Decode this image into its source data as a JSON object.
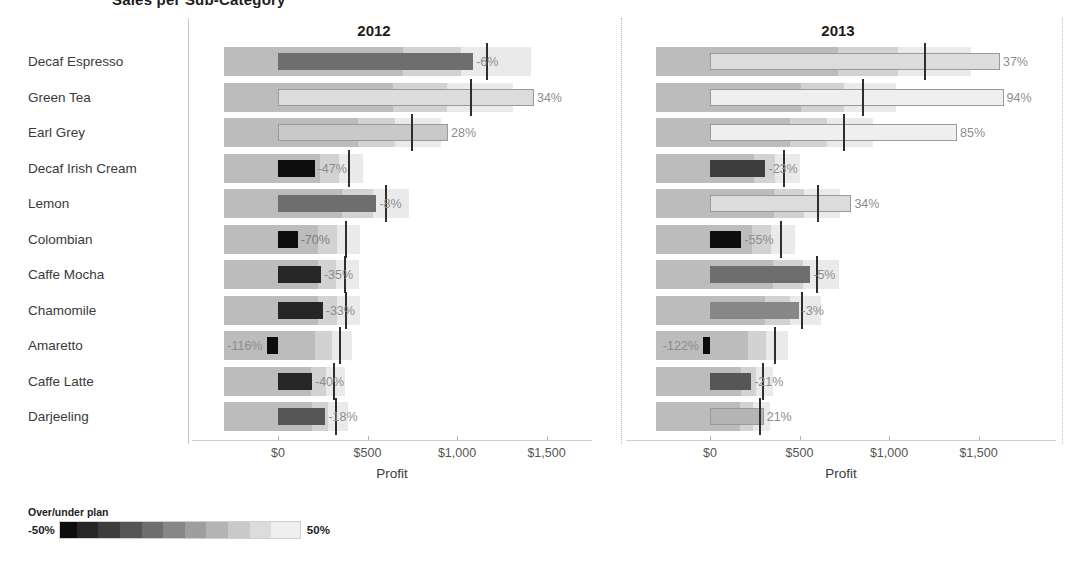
{
  "title_clipped": "Sales per Sub-Category",
  "legend": {
    "title": "Over/under plan",
    "min_label": "-50%",
    "max_label": "50%"
  },
  "axis": {
    "title": "Profit",
    "ticks": [
      "$0",
      "$500",
      "$1,000",
      "$1,500"
    ],
    "tick_values": [
      0,
      500,
      1000,
      1500
    ],
    "min": -300,
    "max": 1700
  },
  "panels": [
    {
      "key": "y2012",
      "label": "2012"
    },
    {
      "key": "y2013",
      "label": "2013"
    }
  ],
  "chart_data": {
    "type": "bar",
    "subtype": "bullet-chart",
    "title": "Sales per Sub-Category",
    "xlabel": "Profit",
    "ylabel": "",
    "grid": false,
    "legend_position": "bottom-left",
    "color_legend": {
      "title": "Over/under plan",
      "min": -50,
      "max": 50,
      "min_label": "-50%",
      "max_label": "50%",
      "scale": "greyscale dark=under plan, light=over plan"
    },
    "xlim": [
      -300,
      1700
    ],
    "xticks": [
      0,
      500,
      1000,
      1500
    ],
    "xticklabels": [
      "$0",
      "$500",
      "$1,000",
      "$1,500"
    ],
    "categories": [
      "Decaf Espresso",
      "Green Tea",
      "Earl Grey",
      "Decaf Irish Cream",
      "Lemon",
      "Colombian",
      "Caffe Mocha",
      "Chamomile",
      "Amaretto",
      "Caffe Latte",
      "Darjeeling"
    ],
    "panels": [
      {
        "name": "2012",
        "rows": [
          {
            "category": "Decaf Espresso",
            "profit": 1090,
            "reference": 1160,
            "pct_label": "-6%",
            "pct": -6,
            "label_inside": false
          },
          {
            "category": "Green Tea",
            "profit": 1430,
            "reference": 1075,
            "pct_label": "34%",
            "pct": 34,
            "label_inside": false
          },
          {
            "category": "Earl Grey",
            "profit": 950,
            "reference": 745,
            "pct_label": "28%",
            "pct": 28,
            "label_inside": false
          },
          {
            "category": "Decaf Irish Cream",
            "profit": 205,
            "reference": 390,
            "pct_label": "-47%",
            "pct": -47,
            "label_inside": false
          },
          {
            "category": "Lemon",
            "profit": 550,
            "reference": 600,
            "pct_label": "-8%",
            "pct": -8,
            "label_inside": false
          },
          {
            "category": "Colombian",
            "profit": 110,
            "reference": 375,
            "pct_label": "-70%",
            "pct": -70,
            "label_inside": true
          },
          {
            "category": "Caffe Mocha",
            "profit": 240,
            "reference": 370,
            "pct_label": "-35%",
            "pct": -35,
            "label_inside": false
          },
          {
            "category": "Chamomile",
            "profit": 250,
            "reference": 375,
            "pct_label": "-33%",
            "pct": -33,
            "label_inside": false
          },
          {
            "category": "Amaretto",
            "profit": -60,
            "reference": 340,
            "pct_label": "-116%",
            "pct": -116,
            "label_inside": false
          },
          {
            "category": "Caffe Latte",
            "profit": 190,
            "reference": 305,
            "pct_label": "-40%",
            "pct": -40,
            "label_inside": false
          },
          {
            "category": "Darjeeling",
            "profit": 265,
            "reference": 320,
            "pct_label": "-18%",
            "pct": -18,
            "label_inside": false
          }
        ]
      },
      {
        "name": "2013",
        "rows": [
          {
            "category": "Decaf Espresso",
            "profit": 1620,
            "reference": 1195,
            "pct_label": "37%",
            "pct": 37,
            "label_inside": false
          },
          {
            "category": "Green Tea",
            "profit": 1640,
            "reference": 850,
            "pct_label": "94%",
            "pct": 94,
            "label_inside": false
          },
          {
            "category": "Earl Grey",
            "profit": 1380,
            "reference": 745,
            "pct_label": "85%",
            "pct": 85,
            "label_inside": false
          },
          {
            "category": "Decaf Irish Cream",
            "profit": 310,
            "reference": 410,
            "pct_label": "-23%",
            "pct": -23,
            "label_inside": false
          },
          {
            "category": "Lemon",
            "profit": 790,
            "reference": 595,
            "pct_label": "34%",
            "pct": 34,
            "label_inside": false
          },
          {
            "category": "Colombian",
            "profit": 175,
            "reference": 390,
            "pct_label": "-55%",
            "pct": -55,
            "label_inside": false
          },
          {
            "category": "Caffe Mocha",
            "profit": 560,
            "reference": 590,
            "pct_label": "-5%",
            "pct": -5,
            "label_inside": false
          },
          {
            "category": "Chamomile",
            "profit": 495,
            "reference": 510,
            "pct_label": "-3%",
            "pct": -3,
            "label_inside": false
          },
          {
            "category": "Amaretto",
            "profit": -40,
            "reference": 355,
            "pct_label": "-122%",
            "pct": -122,
            "label_inside": false
          },
          {
            "category": "Caffe Latte",
            "profit": 230,
            "reference": 290,
            "pct_label": "-21%",
            "pct": -21,
            "label_inside": false
          },
          {
            "category": "Darjeeling",
            "profit": 300,
            "reference": 275,
            "pct_label": "21%",
            "pct": 21,
            "label_inside": false
          }
        ]
      }
    ]
  }
}
